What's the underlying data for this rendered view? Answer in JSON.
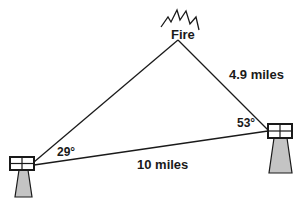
{
  "diagram": {
    "fire_label": "Fire",
    "side_right_label": "4.9 miles",
    "base_label": "10 miles",
    "angle_left": "29°",
    "angle_right": "53°",
    "colors": {
      "line": "#1a1a1a",
      "tower_fill": "#c4c4c4"
    }
  }
}
